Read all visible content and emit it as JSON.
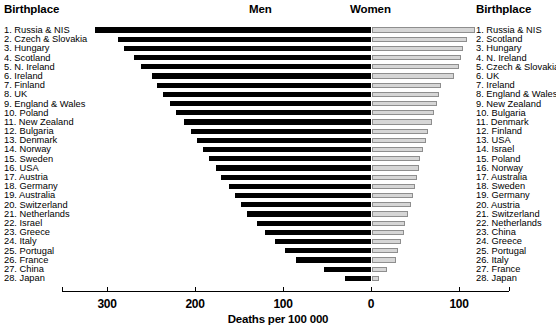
{
  "header": {
    "left_birthplace": "Birthplace",
    "men": "Men",
    "women": "Women",
    "right_birthplace": "Birthplace"
  },
  "axis": {
    "title": "Deaths per 100 000",
    "tick_labels": [
      "300",
      "200",
      "100",
      "0",
      "100"
    ],
    "tick_values": [
      -300,
      -200,
      -100,
      0,
      100
    ],
    "left_max": 330,
    "right_max": 130
  },
  "chart_data": {
    "type": "bar",
    "orientation": "horizontal",
    "style": "back-to-back population pyramid",
    "xlabel": "Deaths per 100 000",
    "ylabel": "Birthplace",
    "xlim": [
      -330,
      130
    ],
    "grid": false,
    "legend": [
      "Men",
      "Women"
    ],
    "legend_position": "top",
    "series": [
      {
        "name": "Men",
        "color": "#000000",
        "categories": [
          "Russia & NIS",
          "Czech & Slovakia",
          "Hungary",
          "Scotland",
          "N. Ireland",
          "Ireland",
          "Finland",
          "UK",
          "England & Wales",
          "Poland",
          "New Zealand",
          "Bulgaria",
          "Denmark",
          "Norway",
          "Sweden",
          "USA",
          "Austria",
          "Germany",
          "Australia",
          "Switzerland",
          "Netherlands",
          "Israel",
          "Greece",
          "Italy",
          "Portugal",
          "France",
          "China",
          "Japan"
        ],
        "values": [
          314,
          288,
          281,
          269,
          261,
          249,
          243,
          236,
          228,
          222,
          213,
          205,
          198,
          191,
          184,
          176,
          170,
          161,
          154,
          148,
          141,
          130,
          120,
          109,
          98,
          85,
          53,
          29
        ]
      },
      {
        "name": "Women",
        "color": "#d6d6d6",
        "categories": [
          "Russia & NIS",
          "Scotland",
          "Hungary",
          "N. Ireland",
          "Czech & Slovakia",
          "UK",
          "Ireland",
          "England & Wales",
          "New Zealand",
          "Bulgaria",
          "Denmark",
          "Finland",
          "USA",
          "Israel",
          "Poland",
          "Norway",
          "Australia",
          "Sweden",
          "Germany",
          "Austria",
          "Switzerland",
          "Netherlands",
          "China",
          "Greece",
          "Portugal",
          "Italy",
          "France",
          "Japan"
        ],
        "values": [
          117,
          108,
          103,
          101,
          99,
          93,
          78,
          76,
          74,
          71,
          68,
          64,
          61,
          58,
          55,
          53,
          51,
          49,
          47,
          44,
          41,
          38,
          36,
          33,
          30,
          27,
          17,
          8
        ]
      }
    ]
  },
  "left_rank_labels": [
    "1. Russia & NIS",
    "2. Czech & Slovakia",
    "3. Hungary",
    "4. Scotland",
    "5. N. Ireland",
    "6. Ireland",
    "7. Finland",
    "8. UK",
    "9. England & Wales",
    "10. Poland",
    "11. New Zealand",
    "12. Bulgaria",
    "13. Denmark",
    "14. Norway",
    "15. Sweden",
    "16. USA",
    "17. Austria",
    "18. Germany",
    "19. Australia",
    "20. Switzerland",
    "21. Netherlands",
    "22. Israel",
    "23. Greece",
    "24. Italy",
    "25. Portugal",
    "26. France",
    "27. China",
    "28. Japan"
  ],
  "right_rank_labels": [
    "1. Russia & NIS",
    "2. Scotland",
    "3. Hungary",
    "4. N. Ireland",
    "5. Czech & Slovakia",
    "6. UK",
    "7. Ireland",
    "8. England & Wales",
    "9. New Zealand",
    "10. Bulgaria",
    "11. Denmark",
    "12. Finland",
    "13. USA",
    "14. Israel",
    "15. Poland",
    "16. Norway",
    "17. Australia",
    "18. Sweden",
    "19. Germany",
    "20. Austria",
    "21. Switzerland",
    "22. Netherlands",
    "23. China",
    "24. Greece",
    "25. Portugal",
    "26. Italy",
    "27. France",
    "28. Japan"
  ]
}
